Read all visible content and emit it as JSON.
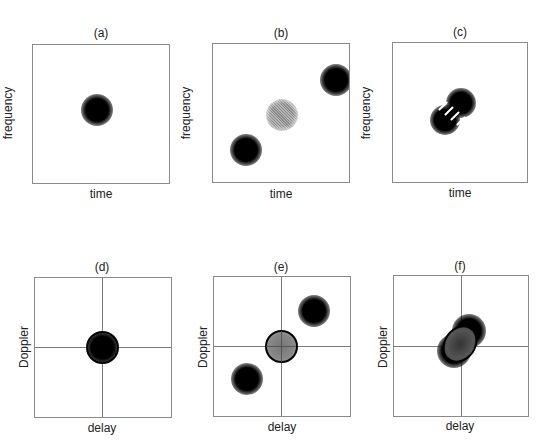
{
  "figure": {
    "panels": [
      {
        "id": "a",
        "title": "(a)",
        "xlabel": "time",
        "ylabel": "frequency",
        "axes_cross": false,
        "description": "single Gaussian atom centered"
      },
      {
        "id": "b",
        "title": "(b)",
        "xlabel": "time",
        "ylabel": "frequency",
        "axes_cross": false,
        "description": "two Gaussian atoms (lower-left, upper-right) with hatched gray interference term at midpoint"
      },
      {
        "id": "c",
        "title": "(c)",
        "xlabel": "time",
        "ylabel": "frequency",
        "axes_cross": false,
        "description": "two closely spaced atoms along diagonal with oscillating interference stripes"
      },
      {
        "id": "d",
        "title": "(d)",
        "xlabel": "delay",
        "ylabel": "Doppler",
        "axes_cross": true,
        "description": "ambiguity function: single centered atom with ring marking kernel region"
      },
      {
        "id": "e",
        "title": "(e)",
        "xlabel": "delay",
        "ylabel": "Doppler",
        "axes_cross": true,
        "description": "ambiguity function: gray auto-term at origin within ring, cross-terms at upper-right and lower-left"
      },
      {
        "id": "f",
        "title": "(f)",
        "xlabel": "delay",
        "ylabel": "Doppler",
        "axes_cross": true,
        "description": "ambiguity function: overlapping terms near origin, elliptical ring"
      }
    ]
  }
}
